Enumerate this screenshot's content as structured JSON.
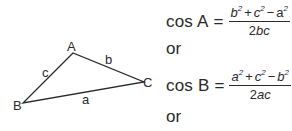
{
  "diagram": {
    "vertices": {
      "A": {
        "label": "A",
        "x": 73,
        "y": 53
      },
      "B": {
        "label": "B",
        "x": 23,
        "y": 103
      },
      "C": {
        "label": "C",
        "x": 144,
        "y": 82
      }
    },
    "sides": {
      "a": {
        "label": "a"
      },
      "b": {
        "label": "b"
      },
      "c": {
        "label": "c"
      }
    },
    "stroke_color": "#2a2a2a"
  },
  "formulas": [
    {
      "lhs": "cos A",
      "eq": "=",
      "num_terms": [
        "b",
        "c",
        "a"
      ],
      "num_ops": [
        "+",
        "−"
      ],
      "exp": "2",
      "den_coef": "2",
      "den_vars": "bc"
    },
    {
      "lhs": "cos B",
      "eq": "=",
      "num_terms": [
        "a",
        "c",
        "b"
      ],
      "num_ops": [
        "+",
        "−"
      ],
      "exp": "2",
      "den_coef": "2",
      "den_vars": "ac"
    }
  ],
  "connectors": [
    "or",
    "or"
  ]
}
